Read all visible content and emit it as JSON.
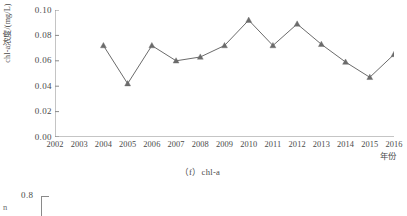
{
  "figure": {
    "caption": "（f）chl-a",
    "y_axis_title": "chl-a浓度/(mg/L)",
    "x_axis_title": "年份"
  },
  "next_figure": {
    "y_tick_visible": "0.8",
    "y_label_fragment": "n"
  },
  "chart_data": {
    "type": "line",
    "title": "（f）chl-a",
    "xlabel": "年份",
    "ylabel": "chl-a浓度/(mg/L)",
    "x_tick_labels": [
      "2002",
      "2003",
      "2004",
      "2005",
      "2006",
      "2007",
      "2008",
      "2009",
      "2010",
      "2011",
      "2012",
      "2013",
      "2014",
      "2015",
      "2016"
    ],
    "y_tick_labels": [
      "0.00",
      "0.02",
      "0.04",
      "0.06",
      "0.08",
      "0.10"
    ],
    "y_ticks": [
      0.0,
      0.02,
      0.04,
      0.06,
      0.08,
      0.1
    ],
    "ylim": [
      0.0,
      0.1
    ],
    "xlim": [
      2002,
      2016
    ],
    "grid": false,
    "legend": false,
    "marker": "triangle",
    "series_color": "#6b6b6b",
    "series": [
      {
        "name": "chl-a",
        "x": [
          2004,
          2005,
          2006,
          2007,
          2008,
          2009,
          2010,
          2011,
          2012,
          2013,
          2014,
          2015,
          2016
        ],
        "values": [
          0.072,
          0.042,
          0.072,
          0.06,
          0.063,
          0.072,
          0.092,
          0.072,
          0.089,
          0.073,
          0.059,
          0.047,
          0.065
        ]
      }
    ]
  }
}
